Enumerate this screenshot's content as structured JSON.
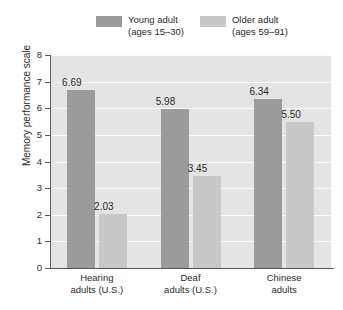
{
  "chart_data": {
    "type": "bar",
    "title": "",
    "xlabel": "",
    "ylabel": "Memory performance scale",
    "ylim": [
      0,
      8
    ],
    "yticks": [
      "0",
      "1",
      "2",
      "3",
      "4",
      "5",
      "6",
      "7",
      "8"
    ],
    "grid": true,
    "legend_position": "top",
    "categories": [
      {
        "line1": "Hearing",
        "line2": "adults (U.S.)"
      },
      {
        "line1": "Deaf",
        "line2": "adults (U.S.)"
      },
      {
        "line1": "Chinese",
        "line2": "adults"
      }
    ],
    "series": [
      {
        "name": "Young adult",
        "name_line2": "(ages 15–30)",
        "color": "#9b9b9b",
        "values": [
          6.69,
          5.98,
          6.34
        ],
        "labels": [
          "6.69",
          "5.98",
          "6.34"
        ]
      },
      {
        "name": "Older adult",
        "name_line2": "(ages 59–91)",
        "color": "#c8c8c8",
        "values": [
          2.03,
          3.45,
          5.5
        ],
        "labels": [
          "2.03",
          "3.45",
          "5.50"
        ]
      }
    ],
    "plot_background": "#e4e4e4",
    "gridline_color": "#fbfbfb",
    "axis_color": "#5a5a5a"
  }
}
